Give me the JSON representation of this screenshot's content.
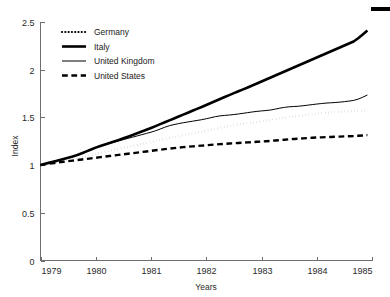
{
  "chart_data": {
    "type": "line",
    "title": "",
    "xlabel": "Years",
    "ylabel": "Index",
    "xlim": [
      1979,
      1985
    ],
    "ylim": [
      0,
      2.5
    ],
    "grid": false,
    "legend_position": "top-left",
    "xticks": [
      "1979",
      "1980",
      "1981",
      "1982",
      "1983",
      "1984",
      "1985"
    ],
    "xtick_values": [
      1979,
      1980,
      1981,
      1982,
      1983,
      1984,
      1985
    ],
    "yticks": [
      "0",
      "0.5",
      "1",
      "1.5",
      "2",
      "2.5"
    ],
    "ytick_values": [
      0,
      0.5,
      1,
      1.5,
      2,
      2.5
    ],
    "x": [
      1979.0,
      1979.083,
      1979.167,
      1979.25,
      1979.333,
      1979.417,
      1979.5,
      1979.583,
      1979.667,
      1979.75,
      1979.833,
      1979.917,
      1980.0,
      1980.083,
      1980.167,
      1980.25,
      1980.333,
      1980.417,
      1980.5,
      1980.583,
      1980.667,
      1980.75,
      1980.833,
      1980.917,
      1981.0,
      1981.083,
      1981.167,
      1981.25,
      1981.333,
      1981.417,
      1981.5,
      1981.583,
      1981.667,
      1981.75,
      1981.833,
      1981.917,
      1982.0,
      1982.083,
      1982.167,
      1982.25,
      1982.333,
      1982.417,
      1982.5,
      1982.583,
      1982.667,
      1982.75,
      1982.833,
      1982.917,
      1983.0,
      1983.083,
      1983.167,
      1983.25,
      1983.333,
      1983.417,
      1983.5,
      1983.583,
      1983.667,
      1983.75,
      1983.833,
      1983.917,
      1984.0,
      1984.083,
      1984.167,
      1984.25,
      1984.333,
      1984.417,
      1984.5,
      1984.583,
      1984.667,
      1984.75,
      1984.833,
      1984.917
    ],
    "series": [
      {
        "name": "Germany",
        "style": "dotted",
        "color": "#000000",
        "linewidth": 2.2,
        "values": [
          1.0,
          1.01,
          1.019,
          1.028,
          1.036,
          1.044,
          1.053,
          1.062,
          1.072,
          1.083,
          1.094,
          1.105,
          1.117,
          1.128,
          1.139,
          1.15,
          1.161,
          1.171,
          1.181,
          1.191,
          1.201,
          1.211,
          1.221,
          1.231,
          1.241,
          1.252,
          1.263,
          1.274,
          1.285,
          1.295,
          1.305,
          1.314,
          1.323,
          1.332,
          1.341,
          1.35,
          1.36,
          1.37,
          1.381,
          1.391,
          1.401,
          1.41,
          1.418,
          1.426,
          1.433,
          1.44,
          1.446,
          1.452,
          1.459,
          1.466,
          1.473,
          1.481,
          1.489,
          1.496,
          1.503,
          1.509,
          1.515,
          1.521,
          1.527,
          1.533,
          1.539,
          1.544,
          1.549,
          1.553,
          1.556,
          1.559,
          1.562,
          1.564,
          1.566,
          1.568,
          1.57,
          1.572
        ]
      },
      {
        "name": "Italy",
        "style": "solid-thick",
        "color": "#000000",
        "linewidth": 2.6,
        "values": [
          1.0,
          1.013,
          1.026,
          1.039,
          1.052,
          1.064,
          1.077,
          1.091,
          1.106,
          1.124,
          1.144,
          1.164,
          1.183,
          1.2,
          1.216,
          1.232,
          1.248,
          1.264,
          1.281,
          1.298,
          1.316,
          1.334,
          1.352,
          1.37,
          1.389,
          1.409,
          1.429,
          1.449,
          1.469,
          1.489,
          1.509,
          1.529,
          1.549,
          1.569,
          1.589,
          1.609,
          1.63,
          1.651,
          1.672,
          1.693,
          1.714,
          1.734,
          1.754,
          1.774,
          1.794,
          1.814,
          1.834,
          1.855,
          1.876,
          1.897,
          1.918,
          1.939,
          1.96,
          1.981,
          2.002,
          2.023,
          2.044,
          2.065,
          2.086,
          2.107,
          2.128,
          2.149,
          2.17,
          2.191,
          2.212,
          2.233,
          2.254,
          2.275,
          2.296,
          2.33,
          2.37,
          2.41
        ]
      },
      {
        "name": "United Kingdom",
        "style": "solid-thin",
        "color": "#000000",
        "linewidth": 1.0,
        "values": [
          1.0,
          1.014,
          1.028,
          1.042,
          1.055,
          1.066,
          1.078,
          1.092,
          1.108,
          1.127,
          1.148,
          1.168,
          1.187,
          1.202,
          1.215,
          1.228,
          1.241,
          1.254,
          1.267,
          1.28,
          1.293,
          1.306,
          1.319,
          1.332,
          1.345,
          1.36,
          1.378,
          1.397,
          1.413,
          1.425,
          1.435,
          1.444,
          1.452,
          1.46,
          1.468,
          1.476,
          1.486,
          1.497,
          1.508,
          1.516,
          1.521,
          1.525,
          1.53,
          1.536,
          1.543,
          1.55,
          1.557,
          1.563,
          1.568,
          1.572,
          1.578,
          1.587,
          1.597,
          1.605,
          1.611,
          1.614,
          1.617,
          1.622,
          1.628,
          1.634,
          1.64,
          1.645,
          1.65,
          1.653,
          1.656,
          1.66,
          1.665,
          1.671,
          1.678,
          1.692,
          1.712,
          1.735
        ]
      },
      {
        "name": "United States",
        "style": "dashed",
        "color": "#000000",
        "linewidth": 2.4,
        "values": [
          1.0,
          1.008,
          1.015,
          1.022,
          1.029,
          1.035,
          1.041,
          1.047,
          1.053,
          1.059,
          1.065,
          1.071,
          1.077,
          1.083,
          1.089,
          1.095,
          1.101,
          1.107,
          1.113,
          1.119,
          1.125,
          1.131,
          1.137,
          1.143,
          1.149,
          1.155,
          1.161,
          1.167,
          1.173,
          1.178,
          1.183,
          1.188,
          1.192,
          1.196,
          1.2,
          1.204,
          1.208,
          1.212,
          1.216,
          1.22,
          1.223,
          1.226,
          1.229,
          1.232,
          1.235,
          1.238,
          1.241,
          1.244,
          1.247,
          1.25,
          1.254,
          1.258,
          1.262,
          1.266,
          1.27,
          1.274,
          1.277,
          1.28,
          1.283,
          1.286,
          1.289,
          1.291,
          1.293,
          1.295,
          1.297,
          1.299,
          1.301,
          1.303,
          1.305,
          1.308,
          1.311,
          1.315
        ]
      }
    ]
  },
  "legend": {
    "items": [
      {
        "label": "Germany"
      },
      {
        "label": "Italy"
      },
      {
        "label": "United Kingdom"
      },
      {
        "label": "United States"
      }
    ]
  }
}
